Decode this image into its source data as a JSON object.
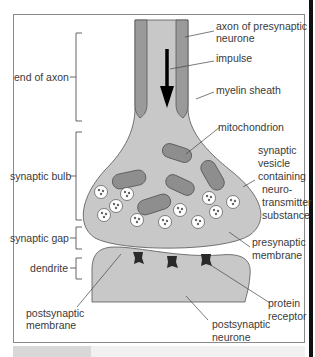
{
  "diagram": {
    "left_labels": {
      "end_of_axon": "end of axon",
      "synaptic_bulb": "synaptic bulb",
      "synaptic_gap": "synaptic gap",
      "dendrite": "dendrite",
      "postsynaptic_membrane_1": "postsynaptic",
      "postsynaptic_membrane_2": "membrane"
    },
    "right_labels": {
      "axon_1": "axon of presynaptic",
      "axon_2": "neurone",
      "impulse": "impulse",
      "myelin": "myelin sheath",
      "mitochondrion": "mitochondrion",
      "vesicle_1": "synaptic",
      "vesicle_2": "vesicle",
      "vesicle_3": "containing",
      "vesicle_4": "neuro-",
      "vesicle_5": "transmitter",
      "vesicle_6": "substance",
      "presyn_1": "presynaptic",
      "presyn_2": "membrane",
      "receptor_1": "protein",
      "receptor_2": "receptor",
      "postneuron_1": "postsynaptic",
      "postneuron_2": "neurone"
    },
    "colors": {
      "cell_fill": "#c8c8c8",
      "myelin_fill": "#9a9a9a",
      "mito_fill": "#8e8e8e",
      "receptor_fill": "#2a2a2a",
      "outline": "#555555",
      "text": "#3a3a3a"
    }
  }
}
